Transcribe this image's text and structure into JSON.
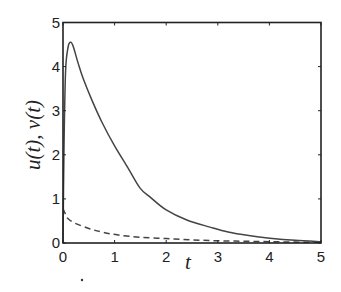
{
  "chart_data": {
    "type": "line",
    "title": "",
    "xlabel": "t",
    "ylabel": "u(t), v(t)",
    "xlim": [
      0,
      5
    ],
    "ylim": [
      0,
      5
    ],
    "xticks": [
      0,
      1,
      2,
      3,
      4,
      5
    ],
    "yticks": [
      0,
      1,
      2,
      3,
      4,
      5
    ],
    "grid": false,
    "legend": null,
    "series": [
      {
        "name": "u(t)",
        "style": "solid",
        "color": "#444444",
        "x": [
          0,
          0.02,
          0.05,
          0.1,
          0.15,
          0.2,
          0.3,
          0.4,
          0.56,
          0.75,
          1.0,
          1.25,
          1.49,
          1.69,
          2.0,
          2.4,
          2.85,
          3.2,
          3.6,
          4.01,
          4.5,
          5.0
        ],
        "y": [
          0,
          2.2,
          3.9,
          4.45,
          4.55,
          4.45,
          4.05,
          3.7,
          3.24,
          2.75,
          2.2,
          1.72,
          1.25,
          1.04,
          0.75,
          0.52,
          0.36,
          0.25,
          0.17,
          0.11,
          0.06,
          0.03
        ]
      },
      {
        "name": "v(t)",
        "style": "dashed",
        "color": "#444444",
        "x": [
          0,
          0.05,
          0.1,
          0.23,
          0.5,
          0.75,
          1.07,
          1.5,
          2.0,
          2.5,
          3.0,
          3.5,
          4.0,
          4.5,
          5.0
        ],
        "y": [
          0.78,
          0.65,
          0.55,
          0.45,
          0.33,
          0.25,
          0.18,
          0.13,
          0.1,
          0.07,
          0.05,
          0.04,
          0.03,
          0.02,
          0.015
        ]
      }
    ]
  },
  "labels": {
    "xlabel": "t",
    "ylabel": "u(t), v(t)",
    "xticks": [
      "0",
      "1",
      "2",
      "3",
      "4",
      "5"
    ],
    "yticks": [
      "0",
      "1",
      "2",
      "3",
      "4",
      "5"
    ]
  }
}
